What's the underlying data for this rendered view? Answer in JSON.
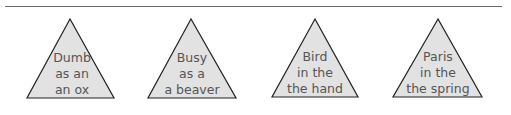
{
  "style": {
    "triangle_fill": "#e2e2e2",
    "triangle_stroke": "#222222",
    "text_color": "#555555",
    "rule_color": "#6b6b6b"
  },
  "triangles": [
    {
      "lines": [
        "Dumb",
        "as an",
        "an ox"
      ]
    },
    {
      "lines": [
        "Busy",
        "as a",
        "a beaver"
      ]
    },
    {
      "lines": [
        "Bird",
        "in the",
        "the hand"
      ]
    },
    {
      "lines": [
        "Paris",
        "in the",
        "the spring"
      ]
    }
  ]
}
